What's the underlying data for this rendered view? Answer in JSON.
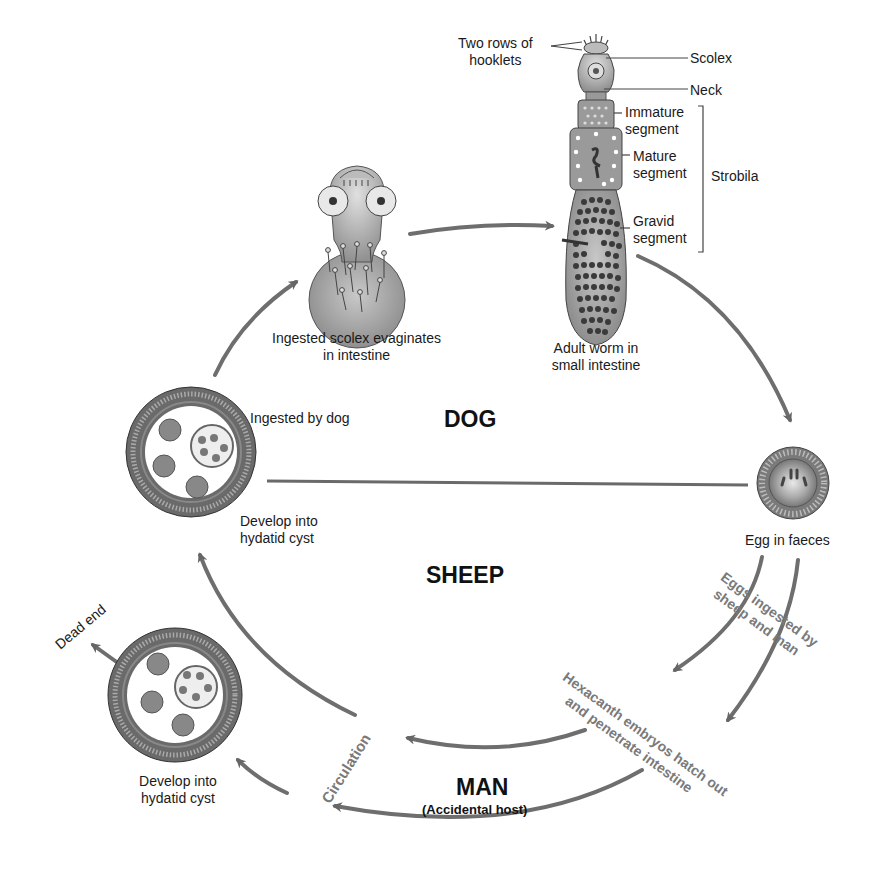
{
  "diagram": {
    "title_hosts": {
      "dog": "DOG",
      "sheep": "SHEEP",
      "man": "MAN",
      "man_note": "(Accidental host)"
    },
    "adult_worm_labels": {
      "hooklets": [
        "Two rows of",
        "hooklets"
      ],
      "scolex": "Scolex",
      "neck": "Neck",
      "immature": [
        "Immature",
        "segment"
      ],
      "mature": [
        "Mature",
        "segment"
      ],
      "gravid": [
        "Gravid",
        "segment"
      ],
      "strobila": "Strobila",
      "caption": [
        "Adult worm in",
        "small intestine"
      ]
    },
    "stages": {
      "scolex_evaginates": [
        "Ingested scolex evaginates",
        "in intestine"
      ],
      "ingested_by_dog": "Ingested by dog",
      "develop_cyst_sheep": [
        "Develop into",
        "hydatid cyst"
      ],
      "egg": "Egg in faeces",
      "eggs_ingested": [
        "Eggs ingested by",
        "sheep and man"
      ],
      "hexacanth": [
        "Hexacanth embryos hatch out",
        "and penetrate intestine"
      ],
      "circulation": "Circulation",
      "develop_cyst_man": [
        "Develop into",
        "hydatid cyst"
      ],
      "dead_end": "Dead end"
    },
    "colors": {
      "arrow": "#6e6e6e",
      "body_fill": "#9a9a9a",
      "dark": "#4a4a4a",
      "grey_text": "#7a7a7a"
    }
  }
}
